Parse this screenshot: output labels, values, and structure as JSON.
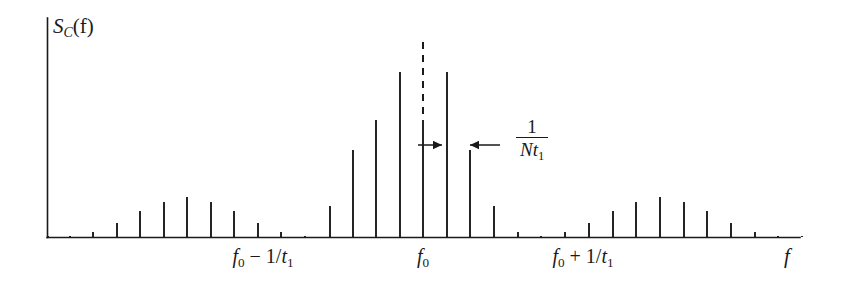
{
  "figure": {
    "name": "coherent-pulse-train-spectrum",
    "y_axis_label_main": "S",
    "y_axis_label_sub": "C",
    "y_axis_label_arg": "(f)",
    "x_axis_label": "f",
    "annotation": {
      "numerator": "1",
      "denominator_N": "N",
      "denominator_t": "t",
      "denominator_sub": "1"
    },
    "tick_labels": [
      {
        "id": "tick-f0-minus",
        "prefix": "f",
        "sub": "0",
        "expr": " − 1/",
        "var": "t",
        "var_sub": "1",
        "x": 263
      },
      {
        "id": "tick-f0",
        "prefix": "f",
        "sub": "0",
        "expr": "",
        "var": "",
        "var_sub": "",
        "x": 423
      },
      {
        "id": "tick-f0-plus",
        "prefix": "f",
        "sub": "0",
        "expr": " + 1/",
        "var": "t",
        "var_sub": "1",
        "x": 583
      }
    ]
  },
  "chart_data": {
    "type": "bar",
    "title": "",
    "subtitle": "",
    "xlabel": "f",
    "ylabel": "S_C(f)",
    "grid": false,
    "legend": null,
    "axes": {
      "x_axis_y_px": 237,
      "x_axis_x0_px": 47,
      "x_axis_x1_px": 800,
      "y_axis_top_px": 18,
      "line_spacing_px": 23.5
    },
    "annotations": [
      {
        "type": "dashed-vertical",
        "name": "envelope-peak-dashed-line",
        "x": 423,
        "y_top": 42,
        "y_bottom": 120
      },
      {
        "type": "double-arrow-span",
        "name": "line-spacing-arrows",
        "label": "1/(N t1)",
        "y": 145,
        "left_arrow_from": 418,
        "left_arrow_to": 442,
        "right_arrow_from": 500,
        "right_arrow_to": 470
      }
    ],
    "x_tick_positions_px": [
      263,
      423,
      583
    ],
    "x_tick_labels": [
      "f0 - 1/t1",
      "f0",
      "f0 + 1/t1"
    ],
    "categories": [
      "-14",
      "-13",
      "-12",
      "-11",
      "-10",
      "-9",
      "-8",
      "-7",
      "-6",
      "-5",
      "-4",
      "-3",
      "-2",
      "-1",
      "0",
      "1",
      "2",
      "3",
      "4",
      "5",
      "6",
      "7",
      "8",
      "9",
      "10",
      "11",
      "12",
      "13",
      "14",
      "15",
      "16",
      "17",
      "18",
      "19",
      "20",
      "21",
      "22",
      "23",
      "24",
      "25",
      "26",
      "27",
      "28",
      "29",
      "30"
    ],
    "x_px": [
      93,
      117,
      140,
      164,
      187,
      211,
      234,
      258,
      281,
      305,
      330,
      353,
      376,
      400,
      423,
      447,
      470,
      494,
      518,
      541,
      565,
      589,
      613,
      636,
      660,
      684,
      707,
      731,
      755,
      778,
      70,
      48,
      802,
      0,
      0,
      0,
      0,
      0,
      0,
      0,
      0,
      0,
      0,
      0,
      0
    ],
    "line_tops_px": [
      232,
      223,
      211,
      202,
      197,
      202,
      211,
      223,
      232,
      236,
      206,
      150,
      120,
      72,
      120,
      72,
      150,
      206,
      232,
      236,
      232,
      223,
      211,
      202,
      197,
      202,
      211,
      223,
      232,
      236,
      236,
      236,
      236,
      0,
      0,
      0,
      0,
      0,
      0,
      0,
      0,
      0,
      0,
      0,
      0
    ],
    "values_normalized": [
      0.02,
      0.06,
      0.12,
      0.16,
      0.18,
      0.16,
      0.12,
      0.06,
      0.02,
      0.0,
      0.14,
      0.4,
      0.53,
      0.75,
      0.53,
      0.75,
      0.4,
      0.14,
      0.02,
      0.0,
      0.02,
      0.06,
      0.12,
      0.16,
      0.18,
      0.16,
      0.12,
      0.06,
      0.02,
      0.0,
      0.0,
      0.0,
      0.0
    ],
    "ylim": [
      0,
      1
    ]
  }
}
